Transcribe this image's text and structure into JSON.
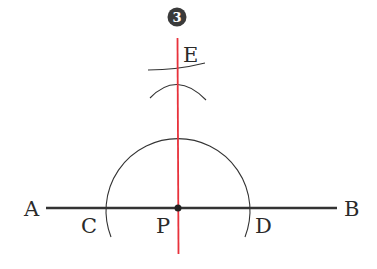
{
  "diagram": {
    "step_badge": "3",
    "colors": {
      "line": "#333333",
      "perpendicular": "#e8323c",
      "badge": "#3a3a3a"
    },
    "points": {
      "A": {
        "label": "A",
        "x": 46,
        "y": 208
      },
      "B": {
        "label": "B",
        "x": 337,
        "y": 208
      },
      "C": {
        "label": "C",
        "x": 106,
        "y": 208
      },
      "D": {
        "label": "D",
        "x": 250,
        "y": 208
      },
      "P": {
        "label": "P",
        "x": 178,
        "y": 208
      },
      "E": {
        "label": "E",
        "x": 177,
        "y": 78
      }
    },
    "labels": {
      "A": "A",
      "B": "B",
      "C": "C",
      "D": "D",
      "P": "P",
      "E": "E"
    }
  }
}
